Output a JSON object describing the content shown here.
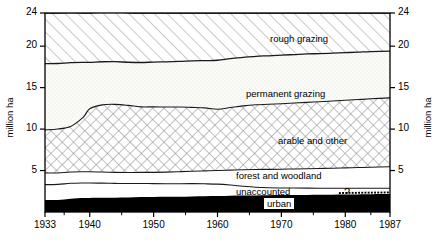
{
  "chart_data": {
    "type": "area",
    "stacked": true,
    "title": "",
    "xlabel": "",
    "ylabel": "million ha",
    "ylabel_right": "million ha",
    "xlim": [
      1933,
      1987
    ],
    "ylim": [
      0,
      24
    ],
    "yticks": [
      5,
      10,
      15,
      20,
      24
    ],
    "ytick_labels": [
      "5",
      "10",
      "15",
      "20",
      "24"
    ],
    "xticks": [
      1933,
      1940,
      1950,
      1960,
      1970,
      1980,
      1987
    ],
    "xtick_labels": [
      "1933",
      "1940",
      "1950",
      "1960",
      "1970",
      "1980",
      "1987"
    ],
    "xminor_ticks": [
      1936,
      1945,
      1955,
      1965,
      1975,
      1984
    ],
    "grid": false,
    "legend": "inline-labels",
    "annotation": "?",
    "x": [
      1933,
      1935,
      1937,
      1939,
      1940,
      1942,
      1944,
      1946,
      1948,
      1950,
      1952,
      1954,
      1956,
      1958,
      1960,
      1962,
      1964,
      1966,
      1968,
      1970,
      1972,
      1974,
      1976,
      1978,
      1980,
      1982,
      1984,
      1987
    ],
    "series": [
      {
        "name": "urban",
        "label": "urban",
        "fill": "solid-black",
        "color": "#000000",
        "values": [
          1.45,
          1.45,
          1.6,
          1.68,
          1.7,
          1.72,
          1.73,
          1.75,
          1.8,
          1.82,
          1.83,
          1.85,
          1.88,
          1.9,
          1.92,
          1.95,
          1.98,
          2.0,
          2.02,
          2.04,
          2.05,
          2.06,
          2.07,
          2.08,
          2.1,
          2.12,
          2.14,
          2.16
        ]
      },
      {
        "name": "unaccounted",
        "label": "unaccounted",
        "fill": "white",
        "color": "#ffffff",
        "values": [
          1.85,
          1.88,
          1.86,
          1.82,
          1.8,
          1.76,
          1.72,
          1.68,
          1.64,
          1.6,
          1.58,
          1.56,
          1.54,
          1.5,
          1.44,
          1.3,
          1.12,
          0.98,
          0.9,
          0.86,
          0.84,
          0.82,
          0.8,
          0.78,
          0.76,
          0.74,
          0.72,
          0.7
        ]
      },
      {
        "name": "forest-and-woodland",
        "label": "forest and woodland",
        "fill": "white",
        "color": "#ffffff",
        "values": [
          1.4,
          1.38,
          1.36,
          1.35,
          1.35,
          1.34,
          1.33,
          1.33,
          1.34,
          1.36,
          1.4,
          1.45,
          1.5,
          1.56,
          1.64,
          1.8,
          2.0,
          2.15,
          2.22,
          2.26,
          2.3,
          2.34,
          2.38,
          2.42,
          2.46,
          2.5,
          2.54,
          2.6
        ]
      },
      {
        "name": "arable-and-other",
        "label": "arable and other",
        "fill": "crosshatch",
        "color": "#ffffff",
        "values": [
          5.2,
          5.3,
          5.5,
          6.6,
          7.6,
          8.1,
          8.2,
          8.1,
          7.9,
          7.9,
          7.85,
          7.8,
          7.7,
          7.6,
          7.4,
          7.55,
          7.7,
          7.8,
          7.85,
          7.9,
          7.95,
          8.0,
          8.05,
          8.1,
          8.15,
          8.2,
          8.25,
          8.3
        ]
      },
      {
        "name": "permanent-grazing",
        "label": "permanent grazing",
        "fill": "stipple",
        "color": "#f4f4f0",
        "values": [
          8.0,
          7.9,
          7.7,
          6.6,
          5.6,
          5.2,
          5.15,
          5.2,
          5.35,
          5.4,
          5.45,
          5.5,
          5.6,
          5.7,
          5.9,
          5.9,
          5.85,
          5.85,
          5.85,
          5.85,
          5.85,
          5.85,
          5.8,
          5.78,
          5.75,
          5.72,
          5.7,
          5.64
        ]
      },
      {
        "name": "rough-grazing",
        "label": "rough grazing",
        "fill": "diagonal-hatch",
        "color": "#ffffff",
        "values": [
          6.1,
          6.09,
          6.02,
          5.95,
          5.95,
          5.98,
          5.99,
          5.95,
          5.97,
          5.92,
          5.89,
          5.84,
          5.78,
          5.74,
          5.7,
          5.5,
          5.35,
          5.22,
          5.16,
          5.09,
          5.01,
          4.93,
          4.9,
          4.84,
          4.78,
          4.72,
          4.65,
          4.6
        ]
      }
    ]
  },
  "labels": {
    "rough_grazing": "rough grazing",
    "permanent_grazing": "permanent grazing",
    "arable_and_other": "arable and other",
    "forest_and_woodland": "forest and woodland",
    "unaccounted": "unaccounted",
    "urban": "urban",
    "question_mark": "?"
  },
  "axes": {
    "y_title_left": "million ha",
    "y_title_right": "million ha",
    "y_ticks": [
      "24",
      "20",
      "15",
      "10",
      "5"
    ],
    "x_ticks": [
      "1933",
      "1940",
      "1950",
      "1960",
      "1970",
      "1980",
      "1987"
    ]
  }
}
